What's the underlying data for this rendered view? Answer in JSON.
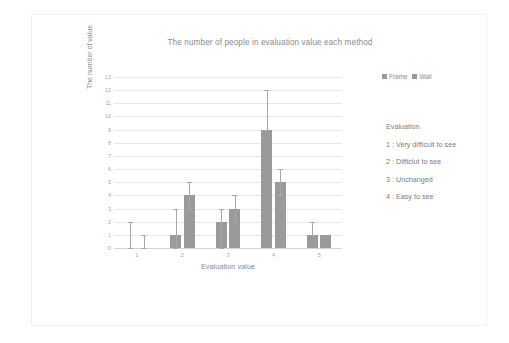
{
  "chart_data": {
    "type": "bar",
    "title": "The number of people in evaluation value each method",
    "xlabel": "Evaluation value",
    "ylabel": "The number of value",
    "categories": [
      "1",
      "2",
      "3",
      "4",
      "5"
    ],
    "ylim": [
      0,
      13
    ],
    "yticks": [
      0,
      1,
      2,
      3,
      4,
      5,
      6,
      7,
      8,
      9,
      10,
      11,
      12,
      13
    ],
    "grid": true,
    "legend_position": "top-right",
    "series": [
      {
        "name": "Frame",
        "color": "#9a9a9a",
        "values": [
          0,
          1,
          2,
          9,
          1
        ],
        "error_upper": [
          2,
          3,
          3,
          12,
          2
        ],
        "error_lower": [
          0,
          0,
          0,
          9,
          1
        ]
      },
      {
        "name": "Wall",
        "color": "#9a9a9a",
        "values": [
          0,
          4,
          3,
          5,
          1
        ],
        "error_upper": [
          1,
          5,
          4,
          6,
          1
        ],
        "error_lower": [
          0,
          3,
          2,
          4,
          1
        ]
      }
    ]
  },
  "legend": {
    "entries": [
      {
        "label": "Frame"
      },
      {
        "label": "Wall"
      }
    ]
  },
  "notes": {
    "heading": "Evaluation",
    "items": [
      "1 : Very difficult to see",
      "2 : Difficlut to see",
      "3 : Unchanged",
      "4 : Easy to see"
    ]
  }
}
